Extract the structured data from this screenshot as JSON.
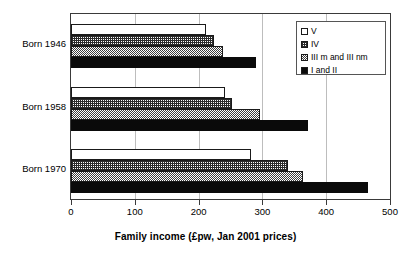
{
  "chart_data": {
    "type": "bar",
    "orientation": "horizontal",
    "title": "",
    "xlabel": "Family income (£pw, Jan 2001 prices)",
    "ylabel": "",
    "xlim": [
      0,
      500
    ],
    "xticks": [
      0,
      100,
      200,
      300,
      400,
      500
    ],
    "xtick_labels": [
      "0",
      "100",
      "200",
      "300",
      "400",
      "500"
    ],
    "grid": true,
    "grid_axis": "x",
    "legend_position": "top-right",
    "categories": [
      "Born 1946",
      "Born 1958",
      "Born 1970"
    ],
    "series": [
      {
        "name": "V",
        "pattern": "white-solid",
        "color": "#ffffff",
        "values": [
          211,
          242,
          282
        ]
      },
      {
        "name": "IV",
        "pattern": "cross-hatch-grid",
        "color": "#ffffff",
        "values": [
          224,
          252,
          340
        ]
      },
      {
        "name": "III m and III nm",
        "pattern": "checkerboard",
        "color": "#808080",
        "values": [
          238,
          297,
          363
        ]
      },
      {
        "name": "I and II",
        "pattern": "solid-black",
        "color": "#000000",
        "values": [
          290,
          372,
          466
        ]
      }
    ]
  },
  "legend": {
    "items": [
      {
        "label": "V"
      },
      {
        "label": "IV"
      },
      {
        "label": "III m and III nm"
      },
      {
        "label": "I and II"
      }
    ]
  }
}
